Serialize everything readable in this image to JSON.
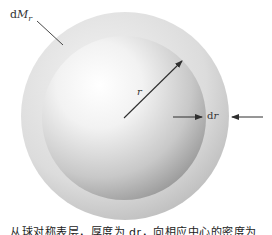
{
  "figure": {
    "shell_label": {
      "prefix": "d",
      "symbol": "M",
      "subscript": "r"
    },
    "radius_label": "r",
    "thickness_label": {
      "prefix": "d",
      "symbol": "r"
    },
    "caption": "从球对称表层，厚度为 dr，向相应中心的密度为"
  },
  "colors": {
    "background": "#ffffff",
    "shell": "#cfcfcf",
    "sphere_highlight": "#ffffff",
    "sphere_shadow": "#9a9a9a",
    "arrows": "#333333"
  }
}
